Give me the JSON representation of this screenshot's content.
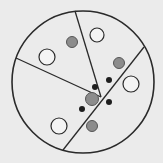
{
  "canvas": {
    "width": 163,
    "height": 163,
    "background": "#ebebeb"
  },
  "colors": {
    "stroke": "#2a2a2a",
    "white_fill": "#f4f4f4",
    "gray_fill": "#8c8c8c",
    "black_fill": "#1e1e1e"
  },
  "outer_circle": {
    "cx": 83,
    "cy": 82,
    "r": 71
  },
  "partition_lines": [
    {
      "name": "top-line",
      "x1": 75,
      "y1": 11,
      "x2": 101,
      "y2": 97
    },
    {
      "name": "left-line",
      "x1": 16,
      "y1": 58,
      "x2": 101,
      "y2": 97
    },
    {
      "name": "diagonal-line",
      "x1": 144,
      "y1": 47,
      "x2": 63,
      "y2": 150
    }
  ],
  "white_circles": [
    {
      "cx": 97,
      "cy": 35,
      "r": 7
    },
    {
      "cx": 47,
      "cy": 57,
      "r": 8
    },
    {
      "cx": 131,
      "cy": 84,
      "r": 8
    },
    {
      "cx": 59,
      "cy": 126,
      "r": 8
    }
  ],
  "gray_circles": [
    {
      "cx": 72,
      "cy": 42,
      "r": 5.5
    },
    {
      "cx": 119,
      "cy": 63,
      "r": 5.5
    },
    {
      "cx": 92,
      "cy": 99,
      "r": 6.5
    },
    {
      "cx": 92,
      "cy": 126,
      "r": 5.5
    }
  ],
  "black_dots": [
    {
      "cx": 109,
      "cy": 80,
      "r": 3
    },
    {
      "cx": 95,
      "cy": 87,
      "r": 3
    },
    {
      "cx": 109,
      "cy": 102,
      "r": 3
    },
    {
      "cx": 82,
      "cy": 109,
      "r": 3
    }
  ]
}
